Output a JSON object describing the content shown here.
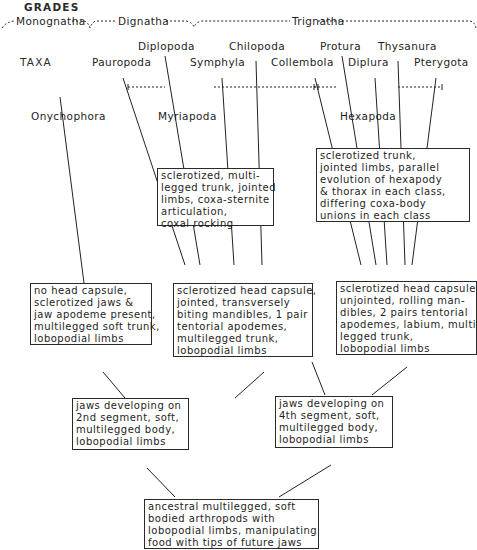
{
  "headings": {
    "grades": "GRADES",
    "taxa": "TAXA"
  },
  "grades": [
    {
      "label": "Monognatha"
    },
    {
      "label": "Dignatha"
    },
    {
      "label": "Trignatha"
    }
  ],
  "taxa": {
    "pauropoda": "Pauropoda",
    "diplopoda": "Diplopoda",
    "symphyla": "Symphyla",
    "chilopoda": "Chilopoda",
    "collembola": "Collembola",
    "protura": "Protura",
    "diplura": "Diplura",
    "thysanura": "Thysanura",
    "pterygota": "Pterygota",
    "onychophora": "Onychophora"
  },
  "groups": {
    "myriapoda": "Myriapoda",
    "hexapoda": "Hexapoda"
  },
  "boxes": {
    "myriapod_trunk": [
      "sclerotized, multi-",
      "legged trunk, jointed",
      "limbs, coxa-sternite",
      "articulation,",
      "coxal  rocking"
    ],
    "hexapod_trunk": [
      "sclerotized  trunk,",
      "jointed  limbs, parallel",
      "evolution  of  hexapody",
      "& thorax  in  each class,",
      "differing  coxa-body",
      "unions  in  each  class"
    ],
    "onychophora_head": [
      "no  head  capsule,",
      "sclerotized  jaws  &",
      "jaw  apodeme  present,",
      "multilegged  soft  trunk,",
      "lobopodial  limbs"
    ],
    "myriapod_head": [
      "sclerotized  head  capsule,",
      "jointed,  transversely",
      "biting  mandibles, 1 pair",
      "tentorial  apodemes,",
      "multilegged  trunk,",
      "lobopodial  limbs"
    ],
    "hexapod_head": [
      "sclerotized  head capsule,",
      "unjointed,  rolling  man-",
      "dibles,  2  pairs  tentorial",
      "apodemes,  labium,  multi-",
      "legged  trunk,",
      "lobopodial  limbs"
    ],
    "jaws_2nd": [
      "jaws  developing  on",
      "2nd  segment,  soft,",
      "multilegged  body,",
      "lobopodial  limbs"
    ],
    "jaws_4th": [
      "jaws  developing  on",
      "4th  segment,  soft,",
      "multilegged  body,",
      "lobopodial  limbs"
    ],
    "ancestral": [
      "ancestral  multilegged,   soft",
      "bodied  arthropods    with",
      "lobopodial  limbs,  manipulating",
      "food  with  tips  of  future  jaws"
    ]
  }
}
